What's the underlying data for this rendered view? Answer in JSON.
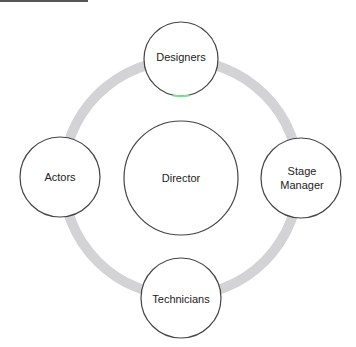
{
  "diagram": {
    "type": "cycle",
    "center_node": {
      "label": "Director"
    },
    "nodes": [
      {
        "label": "Designers",
        "position": "top"
      },
      {
        "label": "Stage\nManager",
        "position": "right"
      },
      {
        "label": "Technicians",
        "position": "bottom"
      },
      {
        "label": "Actors",
        "position": "left"
      }
    ],
    "ring_color": "#d3d3d6",
    "node_border_color": "#444444",
    "highlight_color": "#7ee08a"
  },
  "labels": {
    "director": "Director",
    "designers": "Designers",
    "stage_manager_line1": "Stage",
    "stage_manager_line2": "Manager",
    "technicians": "Technicians",
    "actors": "Actors"
  }
}
